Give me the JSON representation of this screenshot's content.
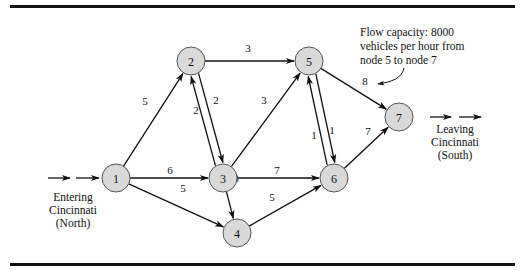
{
  "diagram": {
    "colors": {
      "node_fill": "#d9d9d9",
      "stroke": "#111111",
      "background": "#ffffff"
    },
    "nodes": [
      {
        "id": "1",
        "label": "1",
        "x": 116,
        "y": 178
      },
      {
        "id": "2",
        "label": "2",
        "x": 191,
        "y": 61
      },
      {
        "id": "3",
        "label": "3",
        "x": 223,
        "y": 178
      },
      {
        "id": "4",
        "label": "4",
        "x": 237,
        "y": 233
      },
      {
        "id": "5",
        "label": "5",
        "x": 309,
        "y": 61
      },
      {
        "id": "6",
        "label": "6",
        "x": 334,
        "y": 178
      },
      {
        "id": "7",
        "label": "7",
        "x": 399,
        "y": 117
      }
    ],
    "edges": [
      {
        "from": "1",
        "to": "2",
        "capacity": "5",
        "lx": 145,
        "ly": 101
      },
      {
        "from": "1",
        "to": "3",
        "capacity": "6",
        "lx": 170,
        "ly": 170
      },
      {
        "from": "1",
        "to": "4",
        "capacity": "5",
        "lx": 183,
        "ly": 188
      },
      {
        "from": "2",
        "to": "3",
        "capacity": "2",
        "lx": 196,
        "ly": 110,
        "offset": -4
      },
      {
        "from": "3",
        "to": "2",
        "capacity": "2",
        "lx": 216,
        "ly": 100,
        "offset": -4
      },
      {
        "from": "2",
        "to": "5",
        "capacity": "3",
        "lx": 248,
        "ly": 48
      },
      {
        "from": "3",
        "to": "5",
        "capacity": "3",
        "lx": 264,
        "ly": 100
      },
      {
        "from": "3",
        "to": "6",
        "capacity": "7",
        "lx": 277,
        "ly": 170
      },
      {
        "from": "3",
        "to": "4",
        "capacity": "3",
        "lx": 236,
        "ly": 178
      },
      {
        "from": "4",
        "to": "6",
        "capacity": "5",
        "lx": 272,
        "ly": 197
      },
      {
        "from": "5",
        "to": "6",
        "capacity": "1",
        "lx": 314,
        "ly": 135,
        "offset": -4
      },
      {
        "from": "6",
        "to": "5",
        "capacity": "1",
        "lx": 332,
        "ly": 130,
        "offset": -4
      },
      {
        "from": "5",
        "to": "7",
        "capacity": "8",
        "lx": 365,
        "ly": 81
      },
      {
        "from": "6",
        "to": "7",
        "capacity": "7",
        "lx": 368,
        "ly": 131
      }
    ],
    "entering": {
      "lines": [
        "Entering",
        "Cincinnati",
        "(North)"
      ]
    },
    "leaving": {
      "lines": [
        "Leaving",
        "Cincinnati",
        "(South)"
      ]
    },
    "annotation": {
      "lines": [
        "Flow capacity: 8000",
        "vehicles per hour from",
        "node 5 to node 7"
      ]
    }
  }
}
